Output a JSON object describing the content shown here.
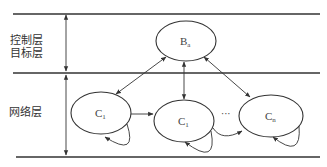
{
  "layers": {
    "top_label_line1": "控制层",
    "top_label_line2": "目标层",
    "bottom_label": "网络层"
  },
  "nodes": {
    "b": {
      "base": "B",
      "sub": "a"
    },
    "c_left": {
      "base": "C",
      "sub": "1"
    },
    "c_mid": {
      "base": "C",
      "sub": "1"
    },
    "c_right": {
      "base": "C",
      "sub": "n"
    }
  },
  "ellipsis": "···",
  "colors": {
    "line": "#333333",
    "text": "#444444",
    "background": "#ffffff"
  }
}
